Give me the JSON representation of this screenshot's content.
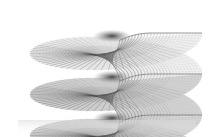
{
  "figure": {
    "background_color": "#ffffff",
    "canvas": {
      "width": 211,
      "height": 137
    },
    "render_style": "wireframe-mesh",
    "surface_type": "riemann-surface-helicoid"
  },
  "chart_data": {
    "type": "surface",
    "subtitle": "",
    "xlabel": "",
    "ylabel": "",
    "zlabel": "",
    "grid": false,
    "axes_visible": false,
    "legend": "none",
    "projection": "3d-orthographic",
    "mesh": {
      "parametrization": "polar",
      "radial_lines": 72,
      "ring_lines": 26,
      "radius_min": 0.04,
      "radius_max": 1.0,
      "theta_min_deg": 0,
      "theta_max_deg": 1080
    },
    "sheets": {
      "count": 3,
      "turns_per_sheet": 1,
      "vertical_pitch_px": 41,
      "sheet_centers_y": [
        33,
        74,
        115
      ],
      "branch_point_x": 116,
      "branch_cut_visible": true
    },
    "view": {
      "elevation_deg": 14,
      "azimuth_deg": -62,
      "x_radius_px": 86,
      "y_radius_px": 26
    },
    "colors": {
      "stroke_light": "#b4b4b4",
      "stroke_mid": "#8c8c8c",
      "stroke_dark": "#4a4a4a",
      "fill_light": "#f0f0f0",
      "fill_mid": "#cfcfcf",
      "fill_dark": "#9a9a9a",
      "shadow": "#6f6f6f",
      "background": "#ffffff"
    },
    "annotations": []
  },
  "accessibility": {
    "alt_text": "Grayscale wireframe rendering of a three-sheeted Riemann surface shaped like a stack of spiral ramps, each with a funnel-shaped vortex at its center."
  }
}
